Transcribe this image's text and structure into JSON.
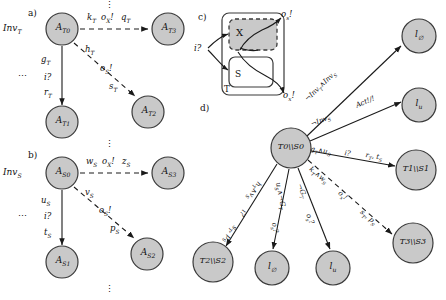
{
  "figure": {
    "panels": [
      {
        "key": "a",
        "label": "a)"
      },
      {
        "key": "b",
        "label": "b)"
      },
      {
        "key": "c",
        "label": "c)"
      },
      {
        "key": "d",
        "label": "d)"
      }
    ]
  },
  "panel_a": {
    "tag": "a)",
    "invariant": "Inv",
    "invariant_sub": "T",
    "nodes": [
      {
        "id": "AT0",
        "name": "A",
        "sub": "T0"
      },
      {
        "id": "AT1",
        "name": "A",
        "sub": "T1"
      },
      {
        "id": "AT2",
        "name": "A",
        "sub": "T2"
      },
      {
        "id": "AT3",
        "name": "A",
        "sub": "T3"
      }
    ],
    "edges": [
      {
        "from": "AT0",
        "to": "AT3",
        "style": "dashed",
        "labels": [
          "k",
          "o",
          "q"
        ],
        "label_text": "kT oX! qT"
      },
      {
        "from": "AT0",
        "to": "AT1",
        "style": "solid",
        "label_text": "gT i? rT"
      },
      {
        "from": "AT0",
        "to": "AT2",
        "style": "dashed",
        "label_text": "hT oS! sT"
      }
    ],
    "edge_labels": {
      "k": "k",
      "k_sub": "T",
      "ox": "o",
      "ox_sub": "X",
      "ox_bang": "!",
      "q": "q",
      "q_sub": "T",
      "g": "g",
      "g_sub": "T",
      "i": "i?",
      "r": "r",
      "r_sub": "T",
      "h": "h",
      "h_sub": "T",
      "os": "o",
      "os_sub": "S",
      "os_bang": "!",
      "s": "s",
      "s_sub": "T",
      "dots": "⋯"
    },
    "vdots": "⋮"
  },
  "panel_b": {
    "tag": "b)",
    "invariant": "Inv",
    "invariant_sub": "S",
    "nodes": [
      {
        "id": "AS0",
        "name": "A",
        "sub": "S0"
      },
      {
        "id": "AS1",
        "name": "A",
        "sub": "S1"
      },
      {
        "id": "AS2",
        "name": "A",
        "sub": "S2"
      },
      {
        "id": "AS3",
        "name": "A",
        "sub": "S3"
      }
    ],
    "edges": [
      {
        "from": "AS0",
        "to": "AS3",
        "style": "dashed",
        "label_text": "wS oX! zS"
      },
      {
        "from": "AS0",
        "to": "AS1",
        "style": "solid",
        "label_text": "uS i? tS"
      },
      {
        "from": "AS0",
        "to": "AS2",
        "style": "dashed",
        "label_text": "vS oS! pS"
      }
    ],
    "edge_labels": {
      "w": "w",
      "w_sub": "S",
      "ox": "o",
      "ox_sub": "X",
      "ox_bang": "!",
      "z": "z",
      "z_sub": "S",
      "u": "u",
      "u_sub": "S",
      "i": "i?",
      "t": "t",
      "t_sub": "S",
      "v": "v",
      "v_sub": "S",
      "os": "o",
      "os_sub": "S",
      "os_bang": "!",
      "p": "p",
      "p_sub": "S",
      "dots": "⋯"
    },
    "vdots": "⋮"
  },
  "panel_c": {
    "tag": "c)",
    "outer_label": "T",
    "box_x": "X",
    "box_s": "S",
    "in_label": "i",
    "in_q": "?",
    "out_s": "o",
    "out_s_sub": "s",
    "out_s_bang": "!",
    "out_x": "o",
    "out_x_sub": "x",
    "out_x_bang": "!"
  },
  "panel_d": {
    "tag": "d)",
    "nodes": [
      {
        "id": "root",
        "label": "T0\\\\S0",
        "x": 291,
        "y": 148,
        "r": 20
      },
      {
        "id": "l0_top",
        "label": "l",
        "sub": "∅",
        "x": 419,
        "y": 36,
        "r": 17
      },
      {
        "id": "lu_top",
        "label": "l",
        "sub": "u",
        "x": 419,
        "y": 105,
        "r": 17
      },
      {
        "id": "T1S1",
        "label": "T1\\\\S1",
        "x": 416,
        "y": 170,
        "r": 20
      },
      {
        "id": "T3S3",
        "label": "T3\\\\S3",
        "x": 413,
        "y": 243,
        "r": 20
      },
      {
        "id": "lu_bot",
        "label": "l",
        "sub": "u",
        "x": 333,
        "y": 268,
        "r": 17
      },
      {
        "id": "l0_bot",
        "label": "l",
        "sub": "∅",
        "x": 272,
        "y": 268,
        "r": 17
      },
      {
        "id": "T2S2",
        "label": "T2\\\\S2",
        "x": 213,
        "y": 262,
        "r": 20
      }
    ],
    "edges": [
      {
        "from": "root",
        "to": "l0_top",
        "style": "solid",
        "label": "¬InvT ∧ InvS"
      },
      {
        "from": "root",
        "to": "lu_top",
        "style": "solid",
        "label": "¬InvS   Act!/!"
      },
      {
        "from": "root",
        "to": "T1S1",
        "style": "solid",
        "label": "gT ∧ uS   i?   rT , tS"
      },
      {
        "from": "root",
        "to": "T3S3",
        "style": "dashed",
        "label": "kT ∧ wS   oX!   sT , pS"
      },
      {
        "from": "root",
        "to": "lu_bot",
        "style": "solid",
        "label": "¬GT   oS?"
      },
      {
        "from": "root",
        "to": "l0_bot",
        "style": "solid",
        "label": "uS ∧ ¬GT   oS?"
      },
      {
        "from": "root",
        "to": "T2S2",
        "style": "solid",
        "label": "hT ∧ vS   i?   sT , pS"
      }
    ],
    "edge_label_parts": {
      "e1_a": "¬Inv",
      "e1_a_sub": "T",
      "e1_and": "∧",
      "e1_b": "Inv",
      "e1_b_sub": "S",
      "e2_a": "¬Inv",
      "e2_a_sub": "S",
      "e2_b": "Act!/!",
      "e3_a": "g",
      "e3_a_sub": "T",
      "e3_and": "∧",
      "e3_b": "u",
      "e3_b_sub": "S",
      "e3_c": "i?",
      "e3_d": "r",
      "e3_d_sub": "T",
      "e3_e": ", t",
      "e3_e_sub": "S",
      "e4_a": "k",
      "e4_a_sub": "T",
      "e4_and": "∧",
      "e4_b": "w",
      "e4_b_sub": "S",
      "e4_c": "o",
      "e4_c_sub": "X",
      "e4_c_bang": "!",
      "e4_d": "s",
      "e4_d_sub": "T",
      "e4_e": ", p",
      "e4_e_sub": "S",
      "e5_a": "¬G",
      "e5_a_sub": "T",
      "e5_b": "o",
      "e5_b_sub": "S",
      "e5_b_q": "?",
      "e6_a": "u",
      "e6_a_sub": "S",
      "e6_and": "∧¬G",
      "e6_and_sub": "T",
      "e6_b": "o",
      "e6_b_sub": "S",
      "e6_b_q": "?",
      "e7_a": "h",
      "e7_a_sub": "T",
      "e7_and": "∧",
      "e7_b": "v",
      "e7_b_sub": "S",
      "e7_c": "i?",
      "e7_d": "s",
      "e7_d_sub": "T",
      "e7_e": ", p",
      "e7_e_sub": "S"
    }
  },
  "style": {
    "node_fill": "#c9c9c9",
    "node_stroke": "#3a3a3a",
    "edge_color": "#1a1a1a",
    "box_fill_x": "#c9c9c9",
    "background": "#ffffff"
  }
}
